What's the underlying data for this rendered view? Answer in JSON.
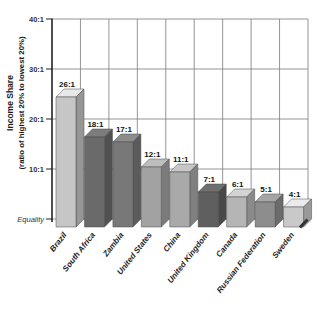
{
  "figure": {
    "background": "#ffffff"
  },
  "colors": {
    "axis": "#222222",
    "grid": "#7a7a7a",
    "tick_text": "#333333",
    "value_text": "#111111",
    "category_text": "#222222",
    "floor_edge": "#333333"
  },
  "chart_data": {
    "type": "bar",
    "variant": "3d-column-grayscale",
    "title": "",
    "xlabel": "",
    "ylabel": "Income Share (ratio of highest 20% to lowest 20%)",
    "ylabel_lines": [
      "Income Share",
      "(ratio of highest 20% to lowest 20%)"
    ],
    "categories": [
      "Brazil",
      "South Africa",
      "Zambia",
      "United States",
      "China",
      "United Kingdom",
      "Canada",
      "Russian Federation",
      "Sweden"
    ],
    "values": [
      26,
      18,
      17,
      12,
      11,
      7,
      6,
      5,
      4
    ],
    "value_labels": [
      "26:1",
      "18:1",
      "17:1",
      "12:1",
      "11:1",
      "7:1",
      "6:1",
      "5:1",
      "4:1"
    ],
    "bar_colors": [
      "#c6c6c6",
      "#6a6a6a",
      "#787878",
      "#a2a2a2",
      "#a9a9a9",
      "#5f5f5f",
      "#b5b5b5",
      "#8d8d8d",
      "#c9c9c9"
    ],
    "y_ticks": [
      {
        "value": 40,
        "label": "40:1",
        "italic": false
      },
      {
        "value": 30,
        "label": "30:1",
        "italic": false
      },
      {
        "value": 20,
        "label": "20:1",
        "italic": false
      },
      {
        "value": 10,
        "label": "10:1",
        "italic": false
      },
      {
        "value": 0,
        "label": "Equality",
        "italic": true
      }
    ],
    "ylim": [
      0,
      40
    ],
    "grid": "both",
    "legend": "none"
  }
}
